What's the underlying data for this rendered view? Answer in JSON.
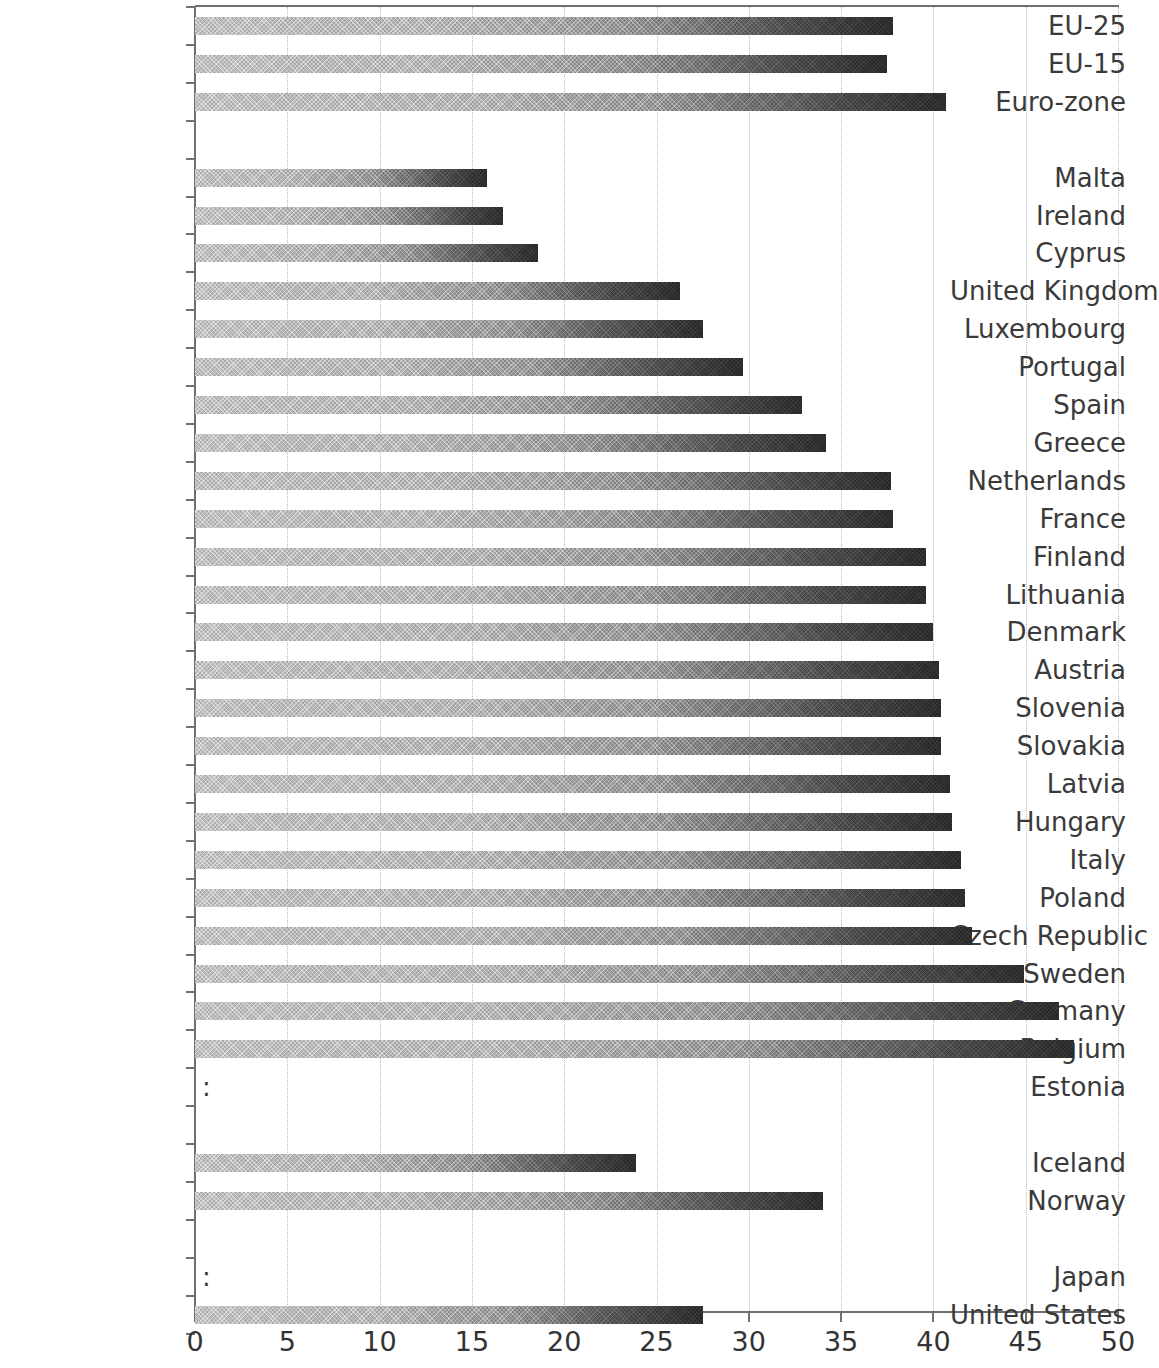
{
  "chart_data": {
    "type": "bar",
    "orientation": "horizontal",
    "title": "",
    "subtitle": "",
    "xlabel": "",
    "ylabel": "",
    "xlim": [
      0,
      50
    ],
    "xticks": [
      0,
      5,
      10,
      15,
      20,
      25,
      30,
      35,
      40,
      45,
      50
    ],
    "xtick_labels": [
      "0",
      "5",
      "10",
      "15",
      "20",
      "25",
      "30",
      "35",
      "40",
      "45",
      "50"
    ],
    "grid": true,
    "grid_axis": "x",
    "grid_style": "dotted",
    "legend": null,
    "missing_value_symbol": ":",
    "bar_color": "#8f8f8f",
    "bar_end_color": "#2a2a2a",
    "grid_color": "#b9b9b9",
    "axis_color": "#6f6f6f",
    "label_color": "#3a3a3a",
    "categories": [
      "EU-25",
      "EU-15",
      "Euro-zone",
      "",
      "Malta",
      "Ireland",
      "Cyprus",
      "United Kingdom",
      "Luxembourg",
      "Portugal",
      "Spain",
      "Greece",
      "Netherlands",
      "France",
      "Finland",
      "Lithuania",
      "Denmark",
      "Austria",
      "Slovenia",
      "Slovakia",
      "Latvia",
      "Hungary",
      "Italy",
      "Poland",
      "Czech Republic",
      "Sweden",
      "Germany",
      "Belgium",
      "Estonia",
      "",
      "Iceland",
      "Norway",
      "",
      "Japan",
      "United States"
    ],
    "values": [
      37.8,
      37.5,
      40.7,
      null,
      15.8,
      16.7,
      18.6,
      26.3,
      27.5,
      29.7,
      32.9,
      34.2,
      37.7,
      37.8,
      39.6,
      39.6,
      40.0,
      40.3,
      40.4,
      40.4,
      40.9,
      41.0,
      41.5,
      41.7,
      42.1,
      44.9,
      46.8,
      47.6,
      null,
      null,
      23.9,
      34.0,
      null,
      null,
      27.5
    ],
    "missing": [
      "Estonia",
      "Japan"
    ]
  }
}
